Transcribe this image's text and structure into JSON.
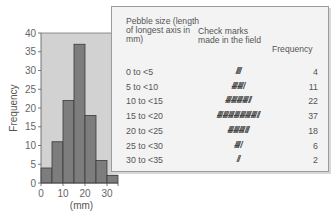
{
  "chart_data": {
    "type": "bar",
    "subtype": "histogram",
    "title": "",
    "xlabel": "(mm)",
    "ylabel": "Frequency",
    "bin_edges": [
      0,
      5,
      10,
      15,
      20,
      25,
      30,
      35
    ],
    "categories": [
      "0 to <5",
      "5 to <10",
      "10 to <15",
      "15 to <20",
      "20 to <25",
      "25 to <30",
      "30 to <35"
    ],
    "values": [
      4,
      11,
      22,
      37,
      18,
      6,
      2
    ],
    "xlim": [
      0,
      35
    ],
    "ylim": [
      0,
      40
    ],
    "xticks": [
      0,
      10,
      20,
      30
    ],
    "yticks": [
      0,
      5,
      10,
      15,
      20,
      25,
      30,
      35,
      40
    ],
    "grid": false,
    "colors": {
      "bar": "#7d7d7d",
      "bar_edge": "#3a3a3a",
      "plot_bg": "#d2d2d2",
      "axis": "#555555"
    }
  },
  "table": {
    "headers": {
      "size": "Pebble size (length of longest axis in mm)",
      "check": "Check marks made in the field",
      "freq": "Frequency"
    },
    "rows": [
      {
        "size": "0 to <5",
        "tally": "////",
        "freq": "4"
      },
      {
        "size": "5 to <10",
        "tally": "⧸⧸⧸⧸̶ ⧸⧸⧸⧸̶ /",
        "freq": "11"
      },
      {
        "size": "10 to <15",
        "tally": "HHH HHH HHH HHH //",
        "freq": "22"
      },
      {
        "size": "15 to <20",
        "tally": "HHH HHH HHH HHH HHH HHH HHH //",
        "freq": "37"
      },
      {
        "size": "20 to <25",
        "tally": "HHH HHH HHH ///",
        "freq": "18"
      },
      {
        "size": "25 to <30",
        "tally": "HHH /",
        "freq": "6"
      },
      {
        "size": "30 to <35",
        "tally": "//",
        "freq": "2"
      }
    ]
  }
}
